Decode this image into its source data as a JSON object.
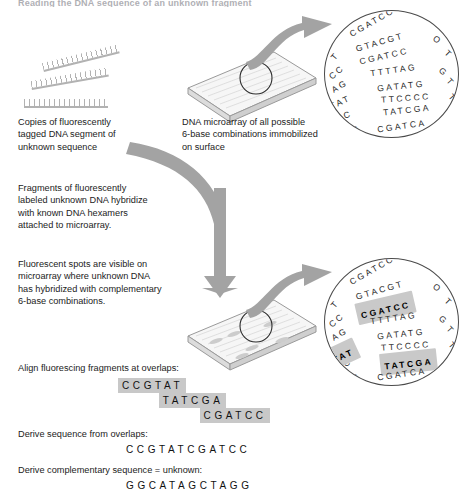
{
  "figure": {
    "truncated_header": "Reading the DNA sequence of an unknown fragment",
    "captions": [
      {
        "name": "caption-fluorescent-copies",
        "text": "Copies of fluorescently\ntagged DNA segment of\nunknown sequence"
      },
      {
        "name": "caption-microarray",
        "text": "DNA microarray of all possible\n6-base combinations immobilized\non surface"
      },
      {
        "name": "caption-hybridize",
        "text": "Fragments of fluorescently\nlabeled unknown DNA hybridize\nwith known DNA hexamers\nattached to microarray."
      },
      {
        "name": "caption-fluorescent-spots",
        "text": "Fluorescent spots are visible on\nmicroarray where unknown DNA\nhas hybridized with complementary\n6-base combinations."
      }
    ],
    "steps": {
      "align_label": "Align fluorescing fragments at overlaps:",
      "derive_label": "Derive sequence from overlaps:",
      "complement_label": "Derive complementary sequence = unknown:"
    },
    "alignment": {
      "fragments": [
        "CCGTAT",
        "TATCGA",
        "CGATCC"
      ],
      "offsets": [
        0,
        3,
        6
      ],
      "derived_sequence": "CCGTATCGATCC",
      "complementary_sequence": "GGCATAGCTAGG"
    },
    "magnifier_top": {
      "label": "all-hexamer-spots",
      "rows": [
        {
          "seq": "CGATCC",
          "x": 22,
          "y": 6,
          "rot": -30,
          "highlight": false
        },
        {
          "seq": "GTACGT",
          "x": 30,
          "y": 26,
          "rot": -16,
          "highlight": false
        },
        {
          "seq": "CGATCC",
          "x": 34,
          "y": 40,
          "rot": -13,
          "highlight": false
        },
        {
          "seq": "TTTTAG",
          "x": 45,
          "y": 54,
          "rot": -8,
          "highlight": false
        },
        {
          "seq": "GATATG",
          "x": 52,
          "y": 70,
          "rot": -6,
          "highlight": false
        },
        {
          "seq": "TTCCCC",
          "x": 56,
          "y": 82,
          "rot": -4,
          "highlight": false
        },
        {
          "seq": "TATCGA",
          "x": 58,
          "y": 94,
          "rot": -6,
          "highlight": false
        },
        {
          "seq": "CGATCA",
          "x": 52,
          "y": 110,
          "rot": -8,
          "highlight": false
        }
      ],
      "edge_bases": [
        {
          "ch": "T",
          "x": 6,
          "y": 40,
          "rot": -50
        },
        {
          "ch": "CC",
          "x": 3,
          "y": 56,
          "rot": -40
        },
        {
          "ch": "AG",
          "x": 6,
          "y": 70,
          "rot": -30
        },
        {
          "ch": "TAT",
          "x": 4,
          "y": 86,
          "rot": -25
        },
        {
          "ch": "CC",
          "x": 10,
          "y": 100,
          "rot": -20
        },
        {
          "ch": "GA",
          "x": 19,
          "y": 114,
          "rot": -12
        },
        {
          "ch": "ACA",
          "x": 96,
          "y": 121,
          "rot": 30
        },
        {
          "ch": "O",
          "x": 108,
          "y": 24,
          "rot": 40
        },
        {
          "ch": "T",
          "x": 120,
          "y": 38,
          "rot": 45
        },
        {
          "ch": "G",
          "x": 114,
          "y": 56,
          "rot": 42
        },
        {
          "ch": "T",
          "x": 122,
          "y": 66,
          "rot": 48
        },
        {
          "ch": "T",
          "x": 124,
          "y": 82,
          "rot": 50
        }
      ]
    },
    "magnifier_bottom": {
      "label": "hybridized-fluorescent-spots",
      "rows": [
        {
          "seq": "CGATCC",
          "x": 22,
          "y": 6,
          "rot": -30,
          "highlight": false
        },
        {
          "seq": "GTACGT",
          "x": 30,
          "y": 26,
          "rot": -16,
          "highlight": false
        },
        {
          "seq": "CGATCC",
          "x": 34,
          "y": 40,
          "rot": -13,
          "highlight": true
        },
        {
          "seq": "TTTTAG",
          "x": 45,
          "y": 54,
          "rot": -8,
          "highlight": false
        },
        {
          "seq": "GATATG",
          "x": 52,
          "y": 70,
          "rot": -6,
          "highlight": false
        },
        {
          "seq": "TTCCCC",
          "x": 56,
          "y": 82,
          "rot": -4,
          "highlight": false
        },
        {
          "seq": "TATCGA",
          "x": 58,
          "y": 94,
          "rot": -6,
          "highlight": true
        },
        {
          "seq": "CGATCA",
          "x": 52,
          "y": 110,
          "rot": -8,
          "highlight": false
        }
      ],
      "edge_bases": [
        {
          "ch": "T",
          "x": 6,
          "y": 40,
          "rot": -50
        },
        {
          "ch": "CC",
          "x": 3,
          "y": 56,
          "rot": -40
        },
        {
          "ch": "AG",
          "x": 6,
          "y": 70,
          "rot": -30
        },
        {
          "ch": "CC",
          "x": 10,
          "y": 100,
          "rot": -20
        },
        {
          "ch": "GA",
          "x": 19,
          "y": 114,
          "rot": -12
        },
        {
          "ch": "ACA",
          "x": 96,
          "y": 121,
          "rot": 30
        },
        {
          "ch": "O",
          "x": 108,
          "y": 24,
          "rot": 40
        },
        {
          "ch": "T",
          "x": 120,
          "y": 38,
          "rot": 45
        },
        {
          "ch": "G",
          "x": 114,
          "y": 56,
          "rot": 42
        },
        {
          "ch": "T",
          "x": 122,
          "y": 66,
          "rot": 48
        },
        {
          "ch": "T",
          "x": 124,
          "y": 82,
          "rot": 50
        }
      ],
      "edge_highlight": {
        "ch": "TAT",
        "x": 2,
        "y": 84,
        "rot": -25
      }
    },
    "colors": {
      "arrow_gray": "#a0a0a0",
      "highlight_gray": "#c8c8c8",
      "plate_face": "#f4f4f4",
      "plate_edge": "#9a9a9a",
      "circle_stroke": "#4a4a4a",
      "text": "#1a1a1a"
    }
  }
}
